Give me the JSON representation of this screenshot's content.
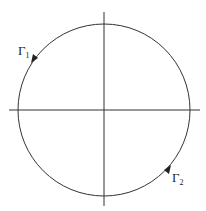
{
  "diagram": {
    "type": "contour-circle-with-axes",
    "stroke_color": "#333333",
    "background": "#ffffff",
    "circle": {
      "cx": 104,
      "cy": 110,
      "r": 86
    },
    "axes": {
      "horizontal": {
        "x1": 9,
        "x2": 200,
        "y": 110
      },
      "vertical": {
        "y1": 12,
        "y2": 206,
        "x": 104
      }
    },
    "labels": [
      {
        "id": "gamma1",
        "symbol": "Γ",
        "subscript": "1",
        "x": 18,
        "y": 55
      },
      {
        "id": "gamma2",
        "symbol": "Γ",
        "subscript": "2",
        "x": 172,
        "y": 180
      }
    ],
    "arrows": [
      {
        "id": "arrow-gamma1",
        "x": 34,
        "y": 58,
        "direction": "counterclockwise"
      },
      {
        "id": "arrow-gamma2",
        "x": 169,
        "y": 170,
        "direction": "counterclockwise"
      }
    ]
  }
}
